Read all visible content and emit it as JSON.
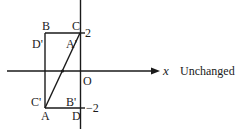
{
  "diagram": {
    "type": "coordinate-geometry",
    "axes": {
      "x_label": "x",
      "origin_label": "O",
      "y_ticks": [
        {
          "value": 2,
          "label": "2"
        },
        {
          "value": -2,
          "label": "−2"
        }
      ]
    },
    "points": {
      "A": "A",
      "B": "B",
      "C": "C",
      "D": "D",
      "A_prime": "A'",
      "B_prime": "B'",
      "C_prime": "C'",
      "D_prime": "D'"
    },
    "annotation": "Unchanged",
    "colors": {
      "stroke": "#1a1a1a",
      "background": "#ffffff"
    }
  }
}
